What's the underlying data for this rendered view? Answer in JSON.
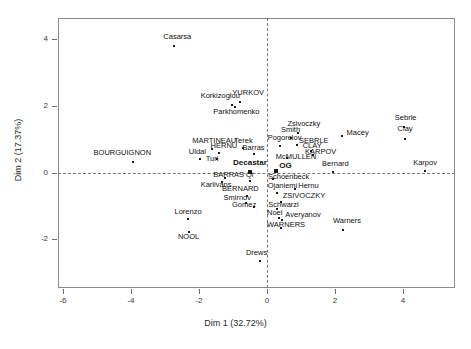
{
  "chart_data": {
    "type": "scatter",
    "title": "",
    "xlabel": "Dim 1 (32.72%)",
    "ylabel": "Dim 2 (17.37%)",
    "xlim": [
      -6.6,
      5.2
    ],
    "ylim": [
      -3.2,
      4.6
    ],
    "xticks": [
      -6,
      -4,
      -2,
      0,
      2,
      4
    ],
    "yticks": [
      4,
      2,
      0,
      -2
    ],
    "grid": false,
    "reference_lines": {
      "vertical_at_x": 0,
      "horizontal_at_y": 0,
      "style": "dashed"
    },
    "legend": "none",
    "points": [
      {
        "label": "Casarsa",
        "x": -2.75,
        "y": 3.8,
        "lx": -3.05,
        "ly": 4.05,
        "bold": false,
        "centroid": false
      },
      {
        "label": "Korkizoglou",
        "x": -1.03,
        "y": 2.02,
        "lx": -1.95,
        "ly": 2.28,
        "bold": false,
        "centroid": false
      },
      {
        "label": "YURKOV",
        "x": -0.78,
        "y": 2.12,
        "lx": -1.02,
        "ly": 2.36,
        "bold": false,
        "centroid": false
      },
      {
        "label": "Parkhomenko",
        "x": -0.93,
        "y": 1.98,
        "lx": -1.58,
        "ly": 1.8,
        "bold": false,
        "centroid": false
      },
      {
        "label": "Sebrle",
        "x": 4.04,
        "y": 1.38,
        "lx": 3.76,
        "ly": 1.62,
        "bold": false,
        "centroid": false
      },
      {
        "label": "Zsivoczky",
        "x": 0.92,
        "y": 1.18,
        "lx": 0.6,
        "ly": 1.43,
        "bold": false,
        "centroid": false
      },
      {
        "label": "Macey",
        "x": 2.21,
        "y": 1.1,
        "lx": 2.34,
        "ly": 1.15,
        "bold": false,
        "centroid": false
      },
      {
        "label": "Clay",
        "x": 4.05,
        "y": 1.02,
        "lx": 3.84,
        "ly": 1.27,
        "bold": false,
        "centroid": false
      },
      {
        "label": "Smith",
        "x": 0.7,
        "y": 1.04,
        "lx": 0.41,
        "ly": 1.26,
        "bold": false,
        "centroid": false
      },
      {
        "label": "SEBRLE",
        "x": 0.88,
        "y": 0.82,
        "lx": 0.94,
        "ly": 0.92,
        "bold": false,
        "centroid": false
      },
      {
        "label": "Pogorelov",
        "x": 0.38,
        "y": 0.81,
        "lx": 0.02,
        "ly": 1.0,
        "bold": false,
        "centroid": false
      },
      {
        "label": "CLAY",
        "x": 1.28,
        "y": 0.66,
        "lx": 1.05,
        "ly": 0.76,
        "bold": false,
        "centroid": false
      },
      {
        "label": "MARTINEAU",
        "x": -1.62,
        "y": 0.72,
        "lx": -2.2,
        "ly": 0.92,
        "bold": false,
        "centroid": false
      },
      {
        "label": "Terek",
        "x": -0.7,
        "y": 0.74,
        "lx": -0.96,
        "ly": 0.92,
        "bold": false,
        "centroid": false
      },
      {
        "label": "HERNU",
        "x": -1.42,
        "y": 0.58,
        "lx": -1.66,
        "ly": 0.76,
        "bold": false,
        "centroid": false
      },
      {
        "label": "Barras",
        "x": -0.38,
        "y": 0.56,
        "lx": -0.72,
        "ly": 0.7,
        "bold": false,
        "centroid": false
      },
      {
        "label": "KARPOV",
        "x": 1.36,
        "y": 0.52,
        "lx": 1.12,
        "ly": 0.58,
        "bold": false,
        "centroid": false
      },
      {
        "label": "Uldal",
        "x": -1.97,
        "y": 0.4,
        "lx": -2.3,
        "ly": 0.58,
        "bold": false,
        "centroid": false
      },
      {
        "label": "McMULLEN",
        "x": 0.58,
        "y": 0.44,
        "lx": 0.26,
        "ly": 0.44,
        "bold": false,
        "centroid": false
      },
      {
        "label": "BOURGUIGNON",
        "x": -3.95,
        "y": 0.32,
        "lx": -5.1,
        "ly": 0.56,
        "bold": false,
        "centroid": false
      },
      {
        "label": "Turi",
        "x": -1.48,
        "y": 0.42,
        "lx": -1.8,
        "ly": 0.38,
        "bold": false,
        "centroid": false
      },
      {
        "label": "Decastar",
        "x": -0.5,
        "y": 0.02,
        "lx": -1.0,
        "ly": 0.27,
        "bold": true,
        "centroid": true
      },
      {
        "label": "Bernard",
        "x": 1.93,
        "y": 0.02,
        "lx": 1.62,
        "ly": 0.24,
        "bold": false,
        "centroid": false
      },
      {
        "label": "Karpov",
        "x": 4.66,
        "y": 0.04,
        "lx": 4.3,
        "ly": 0.26,
        "bold": false,
        "centroid": false
      },
      {
        "label": "OG",
        "x": 0.27,
        "y": 0.06,
        "lx": 0.36,
        "ly": 0.16,
        "bold": true,
        "centroid": true
      },
      {
        "label": "BARRAS",
        "x": -1.25,
        "y": -0.18,
        "lx": -1.58,
        "ly": -0.12,
        "bold": false,
        "centroid": false
      },
      {
        "label": "Qi",
        "x": -0.5,
        "y": -0.25,
        "lx": -0.62,
        "ly": -0.12,
        "bold": false,
        "centroid": false
      },
      {
        "label": "Schoenbeck",
        "x": 0.19,
        "y": -0.21,
        "lx": 0.03,
        "ly": -0.16,
        "bold": false,
        "centroid": false
      },
      {
        "label": "Karlivans",
        "x": -1.32,
        "y": -0.3,
        "lx": -1.95,
        "ly": -0.4,
        "bold": false,
        "centroid": false
      },
      {
        "label": "Ojaniemi",
        "x": 0.3,
        "y": -0.62,
        "lx": 0.02,
        "ly": -0.45,
        "bold": false,
        "centroid": false
      },
      {
        "label": "Hernu",
        "x": 0.82,
        "y": -0.5,
        "lx": 0.92,
        "ly": -0.45,
        "bold": false,
        "centroid": false
      },
      {
        "label": "BERNARD",
        "x": -0.6,
        "y": -0.7,
        "lx": -1.32,
        "ly": -0.52,
        "bold": false,
        "centroid": false
      },
      {
        "label": "ZSIVOCZKY",
        "x": 0.42,
        "y": -0.88,
        "lx": 0.46,
        "ly": -0.74,
        "bold": false,
        "centroid": false
      },
      {
        "label": "Smirnov",
        "x": -0.62,
        "y": -0.92,
        "lx": -1.28,
        "ly": -0.8,
        "bold": false,
        "centroid": false
      },
      {
        "label": "Gomez",
        "x": -0.38,
        "y": -1.03,
        "lx": -1.03,
        "ly": -1.0,
        "bold": false,
        "centroid": false
      },
      {
        "label": "Schwarzl",
        "x": 0.3,
        "y": -1.1,
        "lx": 0.04,
        "ly": -1.02,
        "bold": false,
        "centroid": false
      },
      {
        "label": "Lorenzo",
        "x": -2.32,
        "y": -1.4,
        "lx": -2.72,
        "ly": -1.22,
        "bold": false,
        "centroid": false
      },
      {
        "label": "Noel",
        "x": 0.36,
        "y": -1.38,
        "lx": 0.0,
        "ly": -1.26,
        "bold": false,
        "centroid": false
      },
      {
        "label": "Averyanov",
        "x": 0.44,
        "y": -1.44,
        "lx": 0.54,
        "ly": -1.3,
        "bold": false,
        "centroid": false
      },
      {
        "label": "Warners",
        "x": 2.24,
        "y": -1.72,
        "lx": 1.94,
        "ly": -1.48,
        "bold": false,
        "centroid": false
      },
      {
        "label": "WARNERS",
        "x": 0.4,
        "y": -1.68,
        "lx": 0.0,
        "ly": -1.62,
        "bold": false,
        "centroid": false
      },
      {
        "label": "NOOL",
        "x": -2.3,
        "y": -1.78,
        "lx": -2.62,
        "ly": -1.98,
        "bold": false,
        "centroid": false
      },
      {
        "label": "Drews",
        "x": -0.22,
        "y": -2.66,
        "lx": -0.62,
        "ly": -2.46,
        "bold": false,
        "centroid": false
      }
    ]
  }
}
